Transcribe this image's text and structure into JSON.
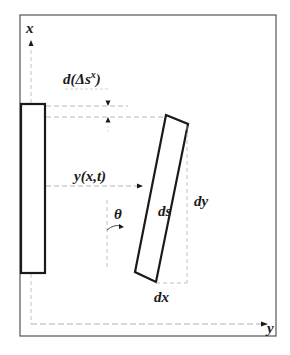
{
  "diagram": {
    "type": "mechanics-schematic",
    "colors": {
      "frame": "#555555",
      "solid": "#1a1a1a",
      "dashed": "#9a9a9a",
      "background": "#ffffff"
    },
    "labels": {
      "x_axis": "x",
      "y_axis": "y",
      "delta_s": "d(Δs",
      "delta_s_sup": "x",
      "delta_s_close": ")",
      "displacement": "y(x,t)",
      "angle": "θ",
      "ds": "ds",
      "dy": "dy",
      "dx": "dx"
    }
  }
}
